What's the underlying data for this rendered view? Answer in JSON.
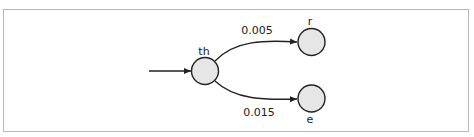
{
  "diagram": {
    "type": "state-transition",
    "colors": {
      "node_fill": "#e6e6e6",
      "node_stroke": "#222222",
      "edge": "#222222",
      "frame_border": "#b8b8b8"
    },
    "nodes": [
      {
        "id": "th",
        "label": "th",
        "x": 205,
        "y": 71,
        "r": 13.5,
        "label_pos": "above"
      },
      {
        "id": "r",
        "label": "r",
        "x": 311.5,
        "y": 42,
        "r": 13.5,
        "label_pos": "above"
      },
      {
        "id": "e",
        "label": "e",
        "x": 311.5,
        "y": 98.5,
        "r": 13.5,
        "label_pos": "below"
      }
    ],
    "edges": [
      {
        "from": "start",
        "to": "th",
        "label": ""
      },
      {
        "from": "th",
        "to": "r",
        "label": "0.005"
      },
      {
        "from": "th",
        "to": "e",
        "label": "0.015"
      }
    ]
  }
}
